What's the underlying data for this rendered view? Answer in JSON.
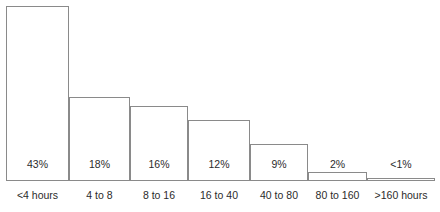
{
  "chart_data": {
    "type": "bar",
    "title": "",
    "subtitle": "",
    "xlabel": "",
    "ylabel": "",
    "ylim": [
      0,
      45
    ],
    "grid": false,
    "legend": false,
    "orientation": "vertical",
    "style": {
      "bar_fill": "#ffffff",
      "bar_stroke": "#8a8a8a",
      "axis_color": "#8a8a8a",
      "text_color": "#2b2b2b",
      "background": "#ffffff"
    },
    "categories": [
      "<4 hours",
      "4 to 8",
      "8 to 16",
      "16 to 40",
      "40 to 80",
      "80 to 160",
      ">160 hours"
    ],
    "values": [
      43,
      18,
      16,
      12,
      9,
      2,
      0.5
    ],
    "data_labels": [
      "43%",
      "18%",
      "16%",
      "12%",
      "9%",
      "2%",
      "<1%"
    ],
    "bars": [
      {
        "category": "<4 hours",
        "value": 43,
        "label": "43%",
        "left": 6,
        "width": 63,
        "height": 175
      },
      {
        "category": "4 to 8",
        "value": 18,
        "label": "18%",
        "left": 69,
        "width": 61,
        "height": 84
      },
      {
        "category": "8 to 16",
        "value": 16,
        "label": "16%",
        "left": 130,
        "width": 58,
        "height": 75
      },
      {
        "category": "16 to 40",
        "value": 12,
        "label": "12%",
        "left": 188,
        "width": 62,
        "height": 61
      },
      {
        "category": "40 to 80",
        "value": 9,
        "label": "9%",
        "left": 250,
        "width": 58,
        "height": 37
      },
      {
        "category": "80 to 160",
        "value": 2,
        "label": "2%",
        "left": 308,
        "width": 59,
        "height": 9
      },
      {
        "category": ">160 hours",
        "value": 0.5,
        "label": "<1%",
        "left": 367,
        "width": 68,
        "height": 3
      }
    ]
  }
}
